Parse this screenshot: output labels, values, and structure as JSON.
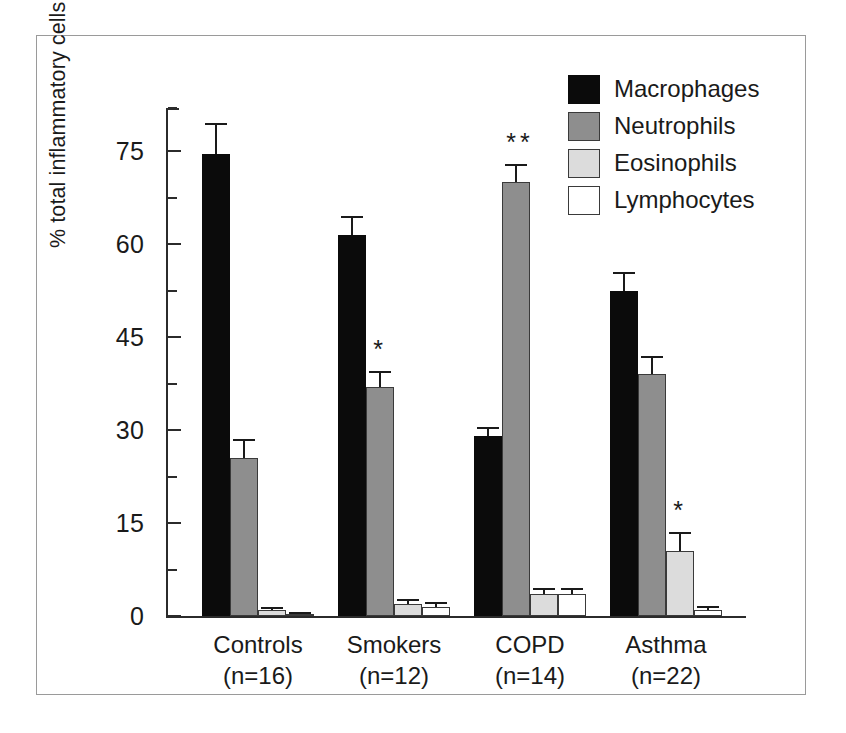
{
  "chart_data": {
    "type": "bar",
    "title": "",
    "subtitle": "",
    "xlabel": "",
    "ylabel": "% total inflammatory cells",
    "ylim": [
      0,
      82
    ],
    "grid": false,
    "legend_position": "top-right",
    "y_ticks_major": [
      0,
      15,
      30,
      45,
      60,
      75
    ],
    "y_tick_labels": [
      "0",
      "15",
      "30",
      "45",
      "60",
      "75"
    ],
    "y_ticks_minor": [
      7.5,
      22.5,
      37.5,
      52.5,
      67.5,
      82
    ],
    "categories": [
      "Controls",
      "Smokers",
      "COPD",
      "Asthma"
    ],
    "category_sublabels": [
      "(n=16)",
      "(n=12)",
      "(n=14)",
      "(n=22)"
    ],
    "series": [
      {
        "name": "Macrophages",
        "color": "#0b0b0b",
        "values": [
          74.5,
          61.5,
          29.0,
          52.5
        ],
        "errors": [
          5.0,
          3.0,
          1.5,
          3.0
        ],
        "significance": [
          "",
          "",
          "",
          ""
        ]
      },
      {
        "name": "Neutrophils",
        "color": "#8e8e8e",
        "values": [
          25.5,
          37.0,
          70.0,
          39.0
        ],
        "errors": [
          3.0,
          2.5,
          3.0,
          3.0
        ],
        "significance": [
          "",
          "*",
          "**",
          ""
        ]
      },
      {
        "name": "Eosinophils",
        "color": "#dcdcdc",
        "values": [
          1.0,
          2.0,
          3.5,
          10.5
        ],
        "errors": [
          0.4,
          0.8,
          1.0,
          3.0
        ],
        "significance": [
          "",
          "",
          "",
          "*"
        ]
      },
      {
        "name": "Lymphocytes",
        "color": "#ffffff",
        "values": [
          0.4,
          1.5,
          3.5,
          1.0
        ],
        "errors": [
          0.2,
          0.8,
          1.0,
          0.6
        ],
        "significance": [
          "",
          "",
          "",
          ""
        ]
      }
    ]
  },
  "legend": {
    "items": [
      {
        "label": "Macrophages",
        "swatch": "macrophages"
      },
      {
        "label": "Neutrophils",
        "swatch": "neutrophils"
      },
      {
        "label": "Eosinophils",
        "swatch": "eosinophils"
      },
      {
        "label": "Lymphocytes",
        "swatch": "lymphocytes"
      }
    ]
  },
  "axis": {
    "y_title": "% total inflammatory cells"
  }
}
